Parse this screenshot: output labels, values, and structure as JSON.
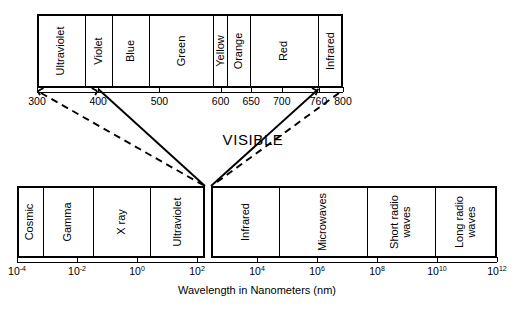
{
  "figure": {
    "visible_word": "VISIBLE",
    "axis_title": "Wavelength in Nanometers (nm)"
  },
  "visible_spectrum_bar": {
    "name": "visible-spectrum-bar",
    "bands": [
      {
        "label": "Ultraviolet",
        "start": 300,
        "end": 380
      },
      {
        "label": "Violet",
        "start": 380,
        "end": 425
      },
      {
        "label": "Blue",
        "start": 425,
        "end": 485
      },
      {
        "label": "Green",
        "start": 485,
        "end": 590
      },
      {
        "label": "Yellow",
        "start": 590,
        "end": 612
      },
      {
        "label": "Orange",
        "start": 612,
        "end": 650
      },
      {
        "label": "Red",
        "start": 650,
        "end": 760
      },
      {
        "label": "Infrared",
        "start": 760,
        "end": 800
      }
    ],
    "axis": {
      "min": 300,
      "max": 800,
      "ticks": [
        {
          "value": 300,
          "label": "300"
        },
        {
          "value": 400,
          "label": "400"
        },
        {
          "value": 500,
          "label": "500"
        },
        {
          "value": 600,
          "label": "600"
        },
        {
          "value": 650,
          "label": "650"
        },
        {
          "value": 700,
          "label": "700"
        },
        {
          "value": 760,
          "label": "760"
        },
        {
          "value": 800,
          "label": "800"
        }
      ]
    }
  },
  "em_spectrum_bar": {
    "name": "electromagnetic-spectrum-bar",
    "bands_left": [
      {
        "label": "Cosmic",
        "start": -4.0,
        "end": -3.1
      },
      {
        "label": "Gamma",
        "start": -3.1,
        "end": -1.45
      },
      {
        "label": "X ray",
        "start": -1.45,
        "end": 0.45
      },
      {
        "label": "Ultraviolet",
        "start": 0.45,
        "end": 2.38
      }
    ],
    "bands_right": [
      {
        "label": "Infrared",
        "start": 2.52,
        "end": 4.75
      },
      {
        "label": "Microwaves",
        "start": 4.75,
        "end": 7.7
      },
      {
        "label": "Short radio waves",
        "start": 7.7,
        "end": 9.95
      },
      {
        "label": "Long radio waves",
        "start": 9.95,
        "end": 12.0
      }
    ],
    "axis": {
      "min_exp": -4,
      "max_exp": 12,
      "ticks": [
        {
          "exp": -4,
          "mantissa": "10",
          "exponent": "-4"
        },
        {
          "exp": -2,
          "mantissa": "10",
          "exponent": "-2"
        },
        {
          "exp": 0,
          "mantissa": "10",
          "exponent": "0"
        },
        {
          "exp": 2,
          "mantissa": "10",
          "exponent": "2"
        },
        {
          "exp": 4,
          "mantissa": "10",
          "exponent": "4"
        },
        {
          "exp": 6,
          "mantissa": "10",
          "exponent": "6"
        },
        {
          "exp": 8,
          "mantissa": "10",
          "exponent": "8"
        },
        {
          "exp": 10,
          "mantissa": "10",
          "exponent": "10"
        },
        {
          "exp": 12,
          "mantissa": "10",
          "exponent": "12"
        }
      ]
    }
  },
  "connector_lines": {
    "solid": [
      {
        "name": "solid-left-400nm"
      },
      {
        "name": "solid-right-760nm"
      }
    ],
    "dashed": [
      {
        "name": "dashed-left-300nm"
      },
      {
        "name": "dashed-right-800nm"
      }
    ]
  }
}
